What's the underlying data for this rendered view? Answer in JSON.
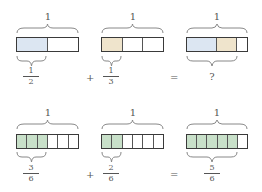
{
  "colors": {
    "blue": "#dce6f2",
    "tan": "#efe4cc",
    "green": "#c8e0c9",
    "border": "#3a3a3a"
  },
  "row1": {
    "whole_label": "1",
    "bar_a": {
      "parts": 2,
      "shaded": [
        1,
        0
      ],
      "fraction": {
        "num": "1",
        "den": "2"
      }
    },
    "op_plus": "+",
    "bar_b": {
      "parts": 3,
      "shaded": [
        1,
        0,
        0
      ],
      "fraction": {
        "num": "1",
        "den": "3"
      }
    },
    "op_equals": "=",
    "bar_c": {
      "segments": [
        "1/2 blue",
        "1/3 tan",
        "1/6 white"
      ],
      "result": "?"
    }
  },
  "row2": {
    "whole_label": "1",
    "bar_a": {
      "parts": 6,
      "shaded": 3,
      "fraction": {
        "num": "3",
        "den": "6"
      }
    },
    "op_plus": "+",
    "bar_b": {
      "parts": 6,
      "shaded": 2,
      "fraction": {
        "num": "2",
        "den": "6"
      }
    },
    "op_equals": "=",
    "bar_c": {
      "parts": 6,
      "shaded": 5,
      "fraction": {
        "num": "5",
        "den": "6"
      }
    }
  }
}
